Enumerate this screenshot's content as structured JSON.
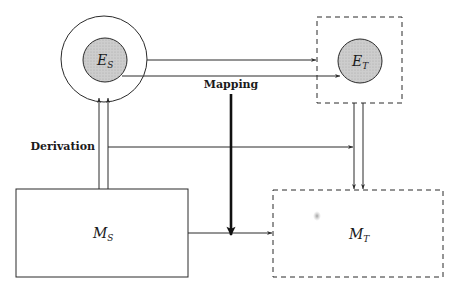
{
  "diagram": {
    "type": "block-diagram",
    "colors": {
      "stroke": "#2a2a2a",
      "fill": "#c9c9c9",
      "background": "#ffffff"
    },
    "nodes": {
      "es": {
        "label": "E",
        "sub": "S",
        "shape": "circle-in-circle",
        "style": "solid"
      },
      "et": {
        "label": "E",
        "sub": "T",
        "shape": "circle-in-dashed-box",
        "style": "dashed"
      },
      "ms": {
        "label": "M",
        "sub": "S",
        "shape": "rectangle",
        "style": "solid"
      },
      "mt": {
        "label": "M",
        "sub": "T",
        "shape": "rectangle",
        "style": "dashed"
      }
    },
    "labels": {
      "mapping": "Mapping",
      "derivation": "Derivation"
    },
    "edges": [
      {
        "from": "E_S outer",
        "to": "E_T box",
        "kind": "mapping"
      },
      {
        "from": "E_S inner",
        "to": "E_T inner",
        "kind": "mapping"
      },
      {
        "from": "M_S",
        "to": "E_S",
        "kind": "derivation",
        "count": 2
      },
      {
        "from": "derivation",
        "to": "E_T box",
        "kind": "derivation"
      },
      {
        "from": "E_T box",
        "to": "M_T",
        "kind": "derivation",
        "count": 2
      },
      {
        "from": "M_S",
        "to": "M_T",
        "kind": "mapping"
      },
      {
        "from": "mapping",
        "to": "M_S→M_T",
        "kind": "mapping-thick"
      }
    ]
  }
}
